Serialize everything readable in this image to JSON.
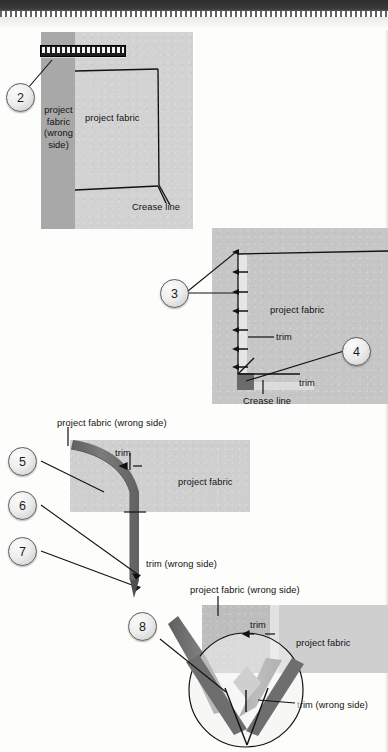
{
  "document": {
    "type": "sewing-instruction-diagram",
    "title": "Mitered trim corner — steps 2 through 8"
  },
  "colors": {
    "fabric_wrong_side": "#a8a8a8",
    "fabric_right_side": "#d2d2d2",
    "trim_dark": "#6e6e6e",
    "ink": "#111111",
    "callout_border": "#5a5a5a"
  },
  "callouts": [
    {
      "number": "2"
    },
    {
      "number": "3"
    },
    {
      "number": "4"
    },
    {
      "number": "5"
    },
    {
      "number": "6"
    },
    {
      "number": "7"
    },
    {
      "number": "8"
    }
  ],
  "panel2": {
    "label_wrong_side": "project fabric (wrong side)",
    "label_wrong_side_lines": [
      "project",
      "fabric",
      "(wrong",
      "side)"
    ],
    "label_fabric": "project fabric",
    "label_crease": "Crease line",
    "tool": "ruler"
  },
  "panel3": {
    "label_fabric": "project fabric",
    "label_trim": "trim",
    "label_trim_2": "trim",
    "label_crease": "Crease line"
  },
  "panel5": {
    "label_wrong_side": "project fabric (wrong side)",
    "label_trim": "trim",
    "label_fabric": "project fabric",
    "label_trim_wrong": "trim (wrong side)"
  },
  "panel8": {
    "label_wrong_side": "project fabric (wrong side)",
    "label_trim": "trim",
    "label_fabric": "project fabric",
    "label_trim_wrong": "trim (wrong side)"
  }
}
